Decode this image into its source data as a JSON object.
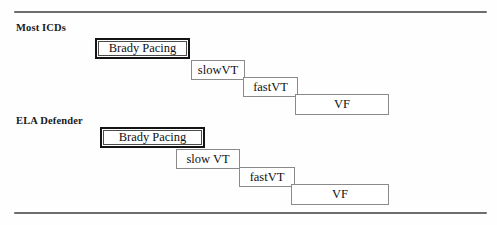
{
  "figure": {
    "background_color": "#fefefe",
    "rule_color": "#6d6d6d",
    "box_border_color": "#8a8a8a",
    "emphasis_border_color": "#141414",
    "text_color": "#111111"
  },
  "rules": {
    "top_label": "top-divider-rule",
    "bottom_label": "bottom-divider-rule"
  },
  "groups": [
    {
      "label": "Most ICDs",
      "zones": [
        {
          "label": "Brady Pacing",
          "style": "emphasis"
        },
        {
          "label": "slowVT",
          "style": "plain"
        },
        {
          "label": "fastVT",
          "style": "plain"
        },
        {
          "label": "VF",
          "style": "plain"
        }
      ]
    },
    {
      "label": "ELA Defender",
      "zones": [
        {
          "label": "Brady Pacing",
          "style": "emphasis"
        },
        {
          "label": "slow VT",
          "style": "plain"
        },
        {
          "label": "fastVT",
          "style": "plain"
        },
        {
          "label": "VF",
          "style": "plain"
        }
      ]
    }
  ]
}
